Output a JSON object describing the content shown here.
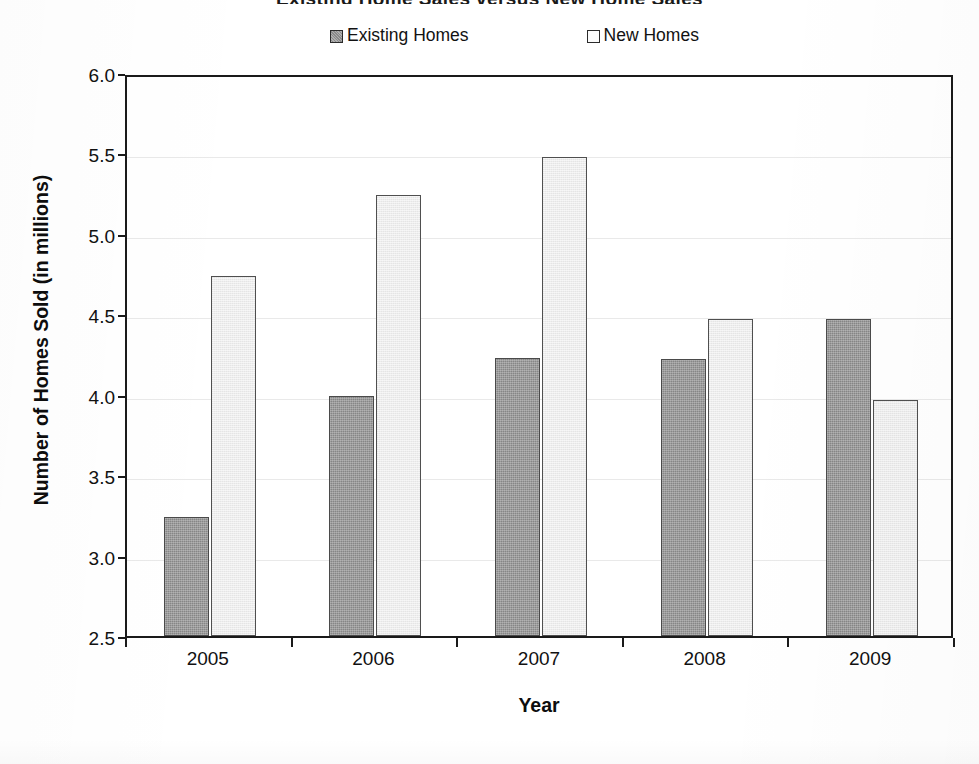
{
  "chart_data": {
    "type": "bar",
    "title": "Existing Home Sales versus New Home Sales",
    "xlabel": "Year",
    "ylabel": "Number of Homes Sold (in millions)",
    "categories": [
      "2005",
      "2006",
      "2007",
      "2008",
      "2009"
    ],
    "series": [
      {
        "name": "Existing Homes",
        "color": "#868686",
        "values": [
          3.24,
          3.99,
          4.23,
          4.22,
          4.47
        ]
      },
      {
        "name": "New Homes",
        "color": "#ededed",
        "values": [
          4.74,
          5.24,
          5.48,
          4.47,
          3.97
        ]
      }
    ],
    "ylim": [
      2.5,
      6.0
    ],
    "ytick_step": 0.5,
    "yticks": [
      "6.0",
      "5.5",
      "5.0",
      "4.5",
      "4.0",
      "3.5",
      "3.0",
      "2.5"
    ],
    "grid": true,
    "legend_position": "top",
    "orientation": "vertical",
    "grouping": "clustered"
  },
  "legend": {
    "entries": [
      {
        "label": "Existing Homes",
        "swatch": "dark-gray-hatched"
      },
      {
        "label": "New Homes",
        "swatch": "light-gray"
      }
    ]
  },
  "axes": {
    "y_title": "Number of Homes Sold (in millions)",
    "x_title": "Year"
  }
}
